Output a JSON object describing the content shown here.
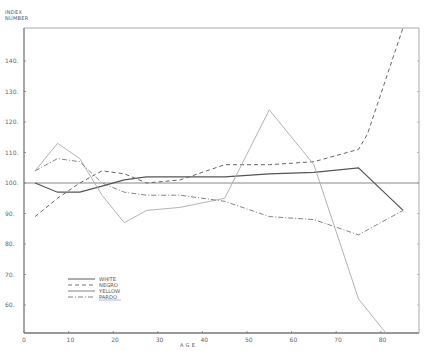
{
  "chart_data": {
    "type": "line",
    "title": "",
    "ylabel": "INDEX NUMBER",
    "xlabel": "A G E",
    "xlim": [
      0,
      88
    ],
    "ylim": [
      51,
      151
    ],
    "x_ticks": [
      0,
      10,
      20,
      30,
      40,
      50,
      60,
      70,
      80
    ],
    "y_ticks": [
      60,
      70,
      80,
      90,
      100,
      110,
      120,
      130,
      140
    ],
    "reference_line": 100,
    "grid": false,
    "legend_position": "lower-left",
    "series": [
      {
        "name": "WHITE",
        "style": "solid",
        "x": [
          2.5,
          7.5,
          12.5,
          17.5,
          22.5,
          27.5,
          35,
          45,
          55,
          65,
          75,
          85
        ],
        "values": [
          100,
          97,
          97,
          99,
          101,
          102,
          102,
          102,
          103,
          103.5,
          105,
          91
        ]
      },
      {
        "name": "NEGRO",
        "style": "dashed",
        "x": [
          2.5,
          7.5,
          12.5,
          17.5,
          22.5,
          27.5,
          35,
          45,
          55,
          65,
          75,
          77,
          85
        ],
        "values": [
          89,
          95,
          100,
          104,
          103,
          100,
          101,
          106,
          106,
          107,
          111,
          116,
          151
        ]
      },
      {
        "name": "YELLOW",
        "style": "dotted",
        "x": [
          2.5,
          7.5,
          12.5,
          17.5,
          22.5,
          27.5,
          35,
          45,
          55,
          65,
          75,
          81
        ],
        "values": [
          104,
          113,
          108,
          96,
          87,
          91,
          92,
          95,
          124,
          106,
          62,
          51
        ]
      },
      {
        "name": "PARDO",
        "style": "dash-dot",
        "x": [
          2.5,
          7.5,
          12.5,
          17.5,
          22.5,
          27.5,
          35,
          45,
          55,
          65,
          75,
          85
        ],
        "values": [
          104,
          108,
          107,
          100,
          97,
          96,
          96,
          94,
          89,
          88,
          83,
          91
        ]
      }
    ]
  },
  "labels": {
    "ylabel_line1": "INDEX",
    "ylabel_line2": "NUMBER",
    "xlabel": "A   G   E"
  },
  "legend": [
    "WHITE",
    "NEGRO",
    "YELLOW",
    "PARDO"
  ]
}
